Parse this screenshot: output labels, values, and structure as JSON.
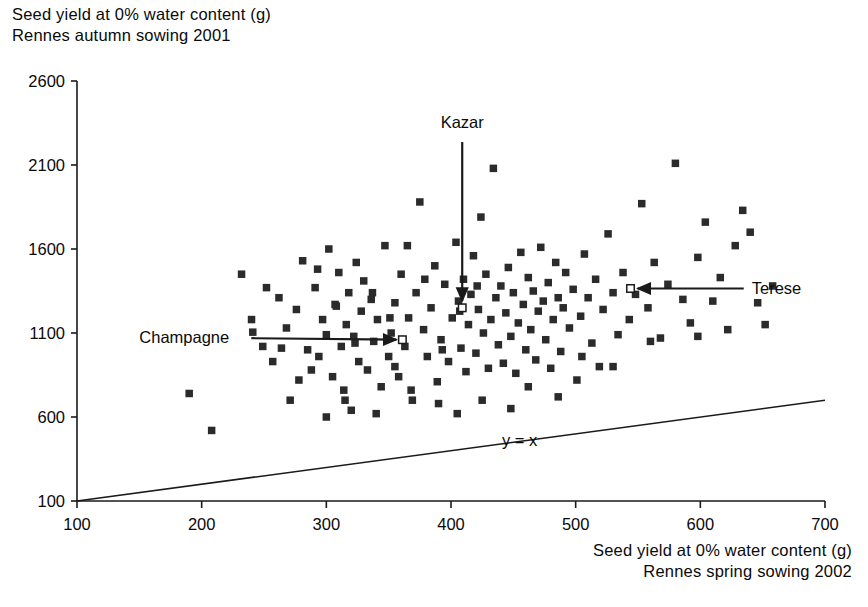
{
  "figure": {
    "y_axis_title_line1": "Seed yield at 0% water content (g)",
    "y_axis_title_line2": "Rennes autumn sowing 2001",
    "x_axis_title_line1": "Seed yield at 0% water content (g)",
    "x_axis_title_line2": "Rennes spring sowing 2002",
    "axis_color": "#1a1a1a",
    "marker_color": "#2b2b2b",
    "background": "#ffffff"
  },
  "chart_data": {
    "type": "scatter",
    "title": "Seed yield at 0% water content (g) Rennes autumn sowing 2001",
    "xlabel": "Seed yield at 0% water content (g) Rennes spring sowing 2002",
    "ylabel": "Seed yield at 0% water content (g) Rennes autumn sowing 2001",
    "xlim": [
      100,
      700
    ],
    "ylim": [
      100,
      2600
    ],
    "xticks": [
      100,
      200,
      300,
      400,
      500,
      600,
      700
    ],
    "yticks": [
      100,
      600,
      1100,
      1600,
      2100,
      2600
    ],
    "grid": false,
    "legend": null,
    "marker": "filled-square",
    "reference_line": {
      "label": "y = x",
      "equation": "y = x",
      "from": [
        100,
        100
      ],
      "to": [
        700,
        700
      ],
      "label_position": [
        455,
        430
      ]
    },
    "series": [
      {
        "name": "accessions",
        "marker": "filled-square",
        "points": [
          [
            190,
            740
          ],
          [
            208,
            520
          ],
          [
            232,
            1450
          ],
          [
            241,
            1105
          ],
          [
            249,
            1020
          ],
          [
            257,
            930
          ],
          [
            262,
            1310
          ],
          [
            268,
            1130
          ],
          [
            271,
            700
          ],
          [
            276,
            1240
          ],
          [
            281,
            1530
          ],
          [
            285,
            1000
          ],
          [
            288,
            880
          ],
          [
            291,
            1370
          ],
          [
            294,
            960
          ],
          [
            297,
            1180
          ],
          [
            300,
            1090
          ],
          [
            302,
            1600
          ],
          [
            305,
            840
          ],
          [
            307,
            1270
          ],
          [
            310,
            1460
          ],
          [
            312,
            1020
          ],
          [
            314,
            760
          ],
          [
            316,
            1150
          ],
          [
            318,
            1340
          ],
          [
            320,
            640
          ],
          [
            322,
            1080
          ],
          [
            324,
            1520
          ],
          [
            326,
            930
          ],
          [
            328,
            1230
          ],
          [
            330,
            1410
          ],
          [
            333,
            880
          ],
          [
            336,
            1300
          ],
          [
            338,
            1050
          ],
          [
            341,
            1180
          ],
          [
            344,
            780
          ],
          [
            347,
            1620
          ],
          [
            350,
            960
          ],
          [
            352,
            1100
          ],
          [
            355,
            1280
          ],
          [
            358,
            840
          ],
          [
            360,
            1450
          ],
          [
            363,
            1020
          ],
          [
            366,
            1190
          ],
          [
            369,
            700
          ],
          [
            372,
            1340
          ],
          [
            375,
            1880
          ],
          [
            378,
            1120
          ],
          [
            381,
            960
          ],
          [
            384,
            1250
          ],
          [
            387,
            1500
          ],
          [
            389,
            810
          ],
          [
            392,
            1060
          ],
          [
            395,
            1390
          ],
          [
            398,
            930
          ],
          [
            401,
            1190
          ],
          [
            404,
            1640
          ],
          [
            406,
            1290
          ],
          [
            408,
            1010
          ],
          [
            410,
            1420
          ],
          [
            412,
            870
          ],
          [
            414,
            1150
          ],
          [
            416,
            1330
          ],
          [
            418,
            1560
          ],
          [
            420,
            980
          ],
          [
            422,
            1240
          ],
          [
            424,
            1790
          ],
          [
            426,
            1100
          ],
          [
            428,
            1450
          ],
          [
            430,
            890
          ],
          [
            432,
            1180
          ],
          [
            434,
            2080
          ],
          [
            436,
            1310
          ],
          [
            438,
            1030
          ],
          [
            440,
            1380
          ],
          [
            442,
            920
          ],
          [
            444,
            1220
          ],
          [
            446,
            1490
          ],
          [
            448,
            1080
          ],
          [
            450,
            1340
          ],
          [
            452,
            860
          ],
          [
            454,
            1160
          ],
          [
            456,
            1580
          ],
          [
            458,
            1270
          ],
          [
            460,
            1000
          ],
          [
            462,
            1430
          ],
          [
            464,
            1120
          ],
          [
            466,
            1350
          ],
          [
            468,
            940
          ],
          [
            470,
            1230
          ],
          [
            472,
            1610
          ],
          [
            474,
            1290
          ],
          [
            476,
            1060
          ],
          [
            478,
            1400
          ],
          [
            480,
            890
          ],
          [
            482,
            1180
          ],
          [
            484,
            1520
          ],
          [
            486,
            1310
          ],
          [
            488,
            990
          ],
          [
            490,
            1250
          ],
          [
            492,
            1460
          ],
          [
            495,
            1130
          ],
          [
            498,
            1360
          ],
          [
            501,
            820
          ],
          [
            504,
            1200
          ],
          [
            507,
            1570
          ],
          [
            510,
            1310
          ],
          [
            513,
            1040
          ],
          [
            516,
            1420
          ],
          [
            519,
            900
          ],
          [
            522,
            1240
          ],
          [
            526,
            1690
          ],
          [
            530,
            1340
          ],
          [
            534,
            1090
          ],
          [
            538,
            1460
          ],
          [
            543,
            1180
          ],
          [
            548,
            1330
          ],
          [
            553,
            1870
          ],
          [
            558,
            1250
          ],
          [
            563,
            1520
          ],
          [
            568,
            1070
          ],
          [
            574,
            1390
          ],
          [
            580,
            2110
          ],
          [
            586,
            1300
          ],
          [
            592,
            1160
          ],
          [
            598,
            1550
          ],
          [
            604,
            1760
          ],
          [
            610,
            1290
          ],
          [
            616,
            1430
          ],
          [
            622,
            1120
          ],
          [
            628,
            1620
          ],
          [
            634,
            1830
          ],
          [
            640,
            1700
          ],
          [
            646,
            1280
          ],
          [
            652,
            1150
          ],
          [
            658,
            1380
          ],
          [
            300,
            600
          ],
          [
            315,
            700
          ],
          [
            340,
            620
          ],
          [
            355,
            900
          ],
          [
            368,
            760
          ],
          [
            390,
            680
          ],
          [
            405,
            620
          ],
          [
            425,
            700
          ],
          [
            448,
            650
          ],
          [
            462,
            780
          ],
          [
            486,
            720
          ],
          [
            505,
            960
          ],
          [
            530,
            900
          ],
          [
            560,
            1050
          ],
          [
            598,
            1080
          ],
          [
            240,
            1180
          ],
          [
            252,
            1370
          ],
          [
            264,
            1010
          ],
          [
            278,
            820
          ],
          [
            293,
            1480
          ],
          [
            308,
            1260
          ],
          [
            323,
            1040
          ],
          [
            337,
            1340
          ],
          [
            351,
            1190
          ],
          [
            365,
            1620
          ],
          [
            379,
            1420
          ],
          [
            393,
            1000
          ],
          [
            407,
            1230
          ],
          [
            421,
            1380
          ]
        ]
      },
      {
        "name": "named varieties",
        "marker": "open-square",
        "points": [
          {
            "label": "Champagne",
            "x": 361,
            "y": 1060
          },
          {
            "label": "Kazar",
            "x": 409,
            "y": 1250
          },
          {
            "label": "Terese",
            "x": 544,
            "y": 1365
          }
        ]
      }
    ],
    "annotations": [
      {
        "name": "Champagne",
        "text": "Champagne",
        "text_x": 150,
        "text_y": 1075,
        "arrow_to_x": 361,
        "arrow_to_y": 1060,
        "direction": "right"
      },
      {
        "name": "Kazar",
        "text": "Kazar",
        "text_x": 409,
        "text_y": 2320,
        "arrow_to_x": 409,
        "arrow_to_y": 1250,
        "direction": "down"
      },
      {
        "name": "Terese",
        "text": "Terese",
        "text_x": 630,
        "text_y": 1365,
        "arrow_to_x": 544,
        "arrow_to_y": 1365,
        "direction": "left"
      }
    ]
  }
}
